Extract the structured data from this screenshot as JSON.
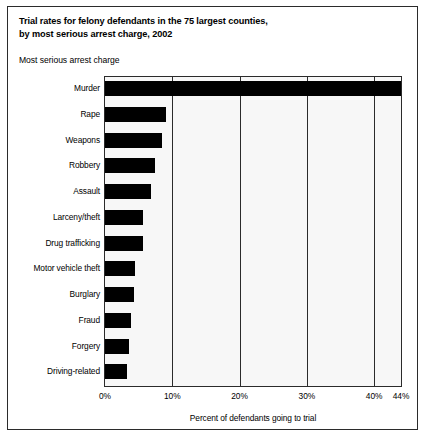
{
  "figure": {
    "title_line1": "Trial rates for felony defendants in the 75 largest counties,",
    "title_line2": "by most serious arrest charge, 2002",
    "axis_heading": "Most serious arrest charge",
    "xlabel": "Percent of defendants going to trial",
    "bar_color": "#000000",
    "plot_bg_color": "#f7f7f7",
    "frame_color": "#2b2b2b"
  },
  "chart_data": {
    "type": "bar",
    "orientation": "horizontal",
    "title": "Trial rates for felony defendants in the 75 largest counties, by most serious arrest charge, 2002",
    "xlabel": "Percent of defendants going to trial",
    "ylabel": "Most serious arrest charge",
    "xlim": [
      0,
      44
    ],
    "xticks": [
      0,
      10,
      20,
      30,
      40,
      44
    ],
    "xticklabels": [
      "0%",
      "10%",
      "20%",
      "30%",
      "40%",
      "44%"
    ],
    "grid": "vertical",
    "legend": "none",
    "categories": [
      "Murder",
      "Rape",
      "Weapons",
      "Robbery",
      "Assault",
      "Larceny/theft",
      "Drug trafficking",
      "Motor vehicle theft",
      "Burglary",
      "Fraud",
      "Forgery",
      "Driving-related"
    ],
    "values": [
      44.0,
      9.0,
      8.4,
      7.4,
      6.9,
      5.7,
      5.6,
      4.4,
      4.3,
      3.9,
      3.6,
      3.3
    ]
  }
}
